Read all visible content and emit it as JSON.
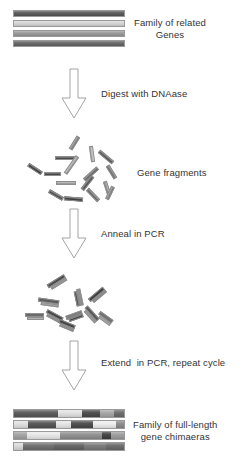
{
  "diagram": {
    "background": "#ffffff",
    "text_color": "#333333"
  },
  "stages": [
    {
      "id": "family-of-genes",
      "label": "Family of related\nGenes",
      "label_line1": "Family of related",
      "label_line2": "Genes",
      "bars": [
        {
          "color": "#595959",
          "y": 10
        },
        {
          "color": "#d6d6d6",
          "y": 20
        },
        {
          "color": "#9a9a9a",
          "y": 30
        },
        {
          "color": "#666666",
          "y": 40
        }
      ]
    },
    {
      "id": "gene-fragments",
      "label": "Gene fragments",
      "fragments": [
        {
          "x": 67,
          "y": 141,
          "w": 15,
          "h": 4,
          "rot": -58,
          "color": "#8c8c8c"
        },
        {
          "x": 55,
          "y": 156,
          "w": 20,
          "h": 4,
          "rot": 0,
          "color": "#4f4f4f"
        },
        {
          "x": 84,
          "y": 152,
          "w": 16,
          "h": 4,
          "rot": 82,
          "color": "#bdbdbd"
        },
        {
          "x": 97,
          "y": 155,
          "w": 18,
          "h": 4,
          "rot": 40,
          "color": "#5a5a5a"
        },
        {
          "x": 27,
          "y": 167,
          "w": 16,
          "h": 4,
          "rot": 33,
          "color": "#3f3f3f"
        },
        {
          "x": 44,
          "y": 172,
          "w": 17,
          "h": 4,
          "rot": 0,
          "color": "#4a4a4a"
        },
        {
          "x": 61,
          "y": 163,
          "w": 21,
          "h": 4,
          "rot": -55,
          "color": "#b0b0b0"
        },
        {
          "x": 82,
          "y": 172,
          "w": 18,
          "h": 4,
          "rot": -42,
          "color": "#6e6e6e"
        },
        {
          "x": 104,
          "y": 170,
          "w": 15,
          "h": 4,
          "rot": 58,
          "color": "#7a7a7a"
        },
        {
          "x": 56,
          "y": 181,
          "w": 20,
          "h": 4,
          "rot": 0,
          "color": "#a8a8a8"
        },
        {
          "x": 79,
          "y": 181,
          "w": 17,
          "h": 4,
          "rot": -52,
          "color": "#555555"
        },
        {
          "x": 100,
          "y": 186,
          "w": 14,
          "h": 4,
          "rot": 72,
          "color": "#9d9d9d"
        },
        {
          "x": 48,
          "y": 193,
          "w": 16,
          "h": 4,
          "rot": 30,
          "color": "#4d4d4d"
        },
        {
          "x": 64,
          "y": 197,
          "w": 19,
          "h": 4,
          "rot": 5,
          "color": "#3d3d3d"
        },
        {
          "x": 85,
          "y": 193,
          "w": 16,
          "h": 4,
          "rot": 46,
          "color": "#707070"
        },
        {
          "x": 103,
          "y": 191,
          "w": 14,
          "h": 4,
          "rot": -64,
          "color": "#8a8a8a"
        }
      ]
    },
    {
      "id": "annealed-fragments",
      "label": "",
      "pairs": [
        {
          "x": 47,
          "y": 279,
          "w": 20,
          "h": 7,
          "rot": -32,
          "c1": "#4a4a4a",
          "c2": "#9b9b9b"
        },
        {
          "x": 70,
          "y": 294,
          "w": 17,
          "h": 7,
          "rot": 78,
          "c1": "#8f8f8f",
          "c2": "#4e4e4e"
        },
        {
          "x": 88,
          "y": 292,
          "w": 19,
          "h": 7,
          "rot": -40,
          "c1": "#3f3f3f",
          "c2": "#8a8a8a"
        },
        {
          "x": 38,
          "y": 299,
          "w": 21,
          "h": 7,
          "rot": 8,
          "c1": "#5b5b5b",
          "c2": "#a5a5a5"
        },
        {
          "x": 25,
          "y": 313,
          "w": 19,
          "h": 7,
          "rot": 0,
          "c1": "#6a6a6a",
          "c2": "#b2b2b2"
        },
        {
          "x": 45,
          "y": 313,
          "w": 18,
          "h": 7,
          "rot": 28,
          "c1": "#474747",
          "c2": "#909090"
        },
        {
          "x": 66,
          "y": 313,
          "w": 17,
          "h": 7,
          "rot": -20,
          "c1": "#7d7d7d",
          "c2": "#3e3e3e"
        },
        {
          "x": 82,
          "y": 311,
          "w": 18,
          "h": 7,
          "rot": 48,
          "c1": "#555555",
          "c2": "#9e9e9e"
        },
        {
          "x": 97,
          "y": 315,
          "w": 16,
          "h": 7,
          "rot": 36,
          "c1": "#6f6f6f",
          "c2": "#adadad"
        },
        {
          "x": 58,
          "y": 322,
          "w": 17,
          "h": 7,
          "rot": 22,
          "c1": "#444444",
          "c2": "#8d8d8d"
        }
      ]
    },
    {
      "id": "gene-chimaeras",
      "label_line1": "Family of full-length",
      "label_line2": "gene chimaeras",
      "bars": [
        {
          "y": 409,
          "segments": [
            {
              "color": "#595959",
              "pct": 40
            },
            {
              "color": "#e2e2e2",
              "pct": 22
            },
            {
              "color": "#4a4a4a",
              "pct": 16
            },
            {
              "color": "#a6a6a6",
              "pct": 13
            },
            {
              "color": "#6b6b6b",
              "pct": 9
            }
          ]
        },
        {
          "y": 420,
          "segments": [
            {
              "color": "#e0e0e0",
              "pct": 13
            },
            {
              "color": "#545454",
              "pct": 25
            },
            {
              "color": "#e6e6e6",
              "pct": 14
            },
            {
              "color": "#4b4b4b",
              "pct": 20
            },
            {
              "color": "#ededed",
              "pct": 21
            },
            {
              "color": "#8a8a8a",
              "pct": 7
            }
          ]
        },
        {
          "y": 431,
          "segments": [
            {
              "color": "#a3a3a3",
              "pct": 12
            },
            {
              "color": "#e8e8e8",
              "pct": 30
            },
            {
              "color": "#8f8f8f",
              "pct": 38
            },
            {
              "color": "#3f3f3f",
              "pct": 8
            },
            {
              "color": "#9c9c9c",
              "pct": 12
            }
          ]
        },
        {
          "y": 442,
          "segments": [
            {
              "color": "#d9d9d9",
              "pct": 8
            },
            {
              "color": "#6d6d6d",
              "pct": 28
            },
            {
              "color": "#636363",
              "pct": 28
            },
            {
              "color": "#787878",
              "pct": 20
            },
            {
              "color": "#6a6a6a",
              "pct": 16
            }
          ]
        }
      ]
    }
  ],
  "arrows": [
    {
      "id": "digest",
      "label": "Digest with DNAase",
      "x": 60,
      "y": 68,
      "w": 28,
      "h": 52,
      "label_x": 101,
      "label_y": 88
    },
    {
      "id": "anneal",
      "label": "Anneal in PCR",
      "x": 60,
      "y": 208,
      "w": 28,
      "h": 52,
      "label_x": 101,
      "label_y": 228
    },
    {
      "id": "extend",
      "label": "Extend  in PCR, repeat cycle",
      "x": 60,
      "y": 340,
      "w": 28,
      "h": 52,
      "label_x": 101,
      "label_y": 357
    }
  ],
  "labels": {
    "family_genes_x": 134,
    "family_genes_y": 17,
    "gene_fragments_x": 137,
    "gene_fragments_y": 167,
    "chimaeras_x": 133,
    "chimaeras_y": 419
  },
  "arrow_style": {
    "stroke": "#9a9a9a",
    "fill": "#ffffff",
    "stroke_width": 0.8
  }
}
